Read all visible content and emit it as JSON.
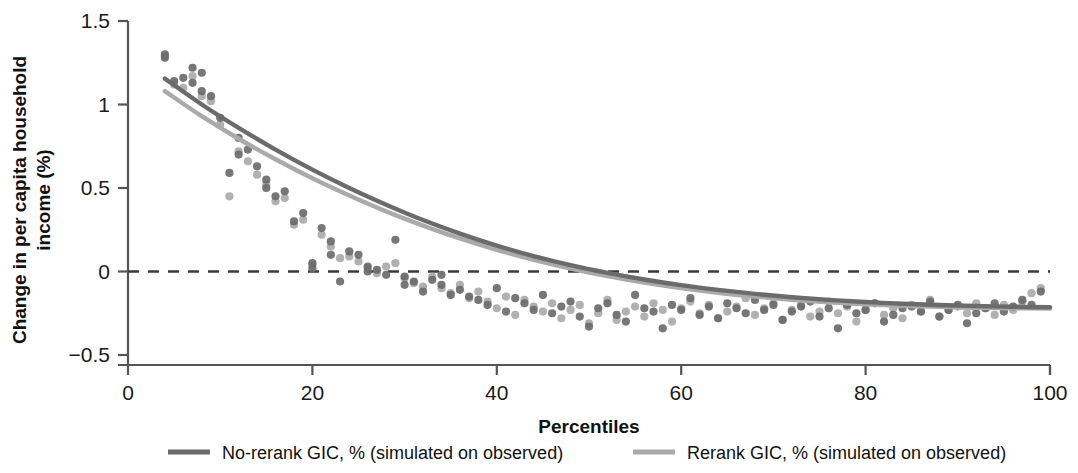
{
  "chart_data": {
    "type": "scatter",
    "title": "",
    "subtitle": "",
    "xlabel": "Percentiles",
    "ylabel": "Change in per capita household income (%)",
    "ylabel_line1": "Change in per capita household",
    "ylabel_line2": "income (%)",
    "xlim": [
      0,
      100
    ],
    "ylim": [
      -0.5,
      1.5
    ],
    "xticks": [
      0,
      20,
      40,
      60,
      80,
      100
    ],
    "xtick_labels": [
      "0",
      "20",
      "40",
      "60",
      "80",
      "100"
    ],
    "yticks": [
      -0.5,
      0,
      0.5,
      1,
      1.5
    ],
    "ytick_labels": [
      "−0.5",
      "0",
      "0.5",
      "1",
      "1.5"
    ],
    "grid": false,
    "legend_position": "bottom",
    "reference_line": {
      "y": 0,
      "style": "dashed",
      "color": "#3a3a3a"
    },
    "colors": {
      "no_rerank": "#6b6b6b",
      "rerank": "#aaaaaa"
    },
    "series": [
      {
        "name": "No-rerank GIC, % (simulated on observed)",
        "color": "#6b6b6b",
        "marker": "circle",
        "x": [
          4,
          4,
          5,
          6,
          7,
          7,
          8,
          8,
          9,
          10,
          11,
          12,
          12,
          13,
          14,
          15,
          15,
          16,
          17,
          18,
          19,
          20,
          20,
          21,
          22,
          22,
          23,
          24,
          25,
          26,
          26,
          27,
          28,
          29,
          30,
          30,
          31,
          32,
          33,
          34,
          34,
          35,
          36,
          37,
          38,
          39,
          40,
          41,
          42,
          43,
          44,
          45,
          46,
          47,
          48,
          49,
          50,
          51,
          52,
          53,
          54,
          55,
          56,
          57,
          58,
          59,
          60,
          61,
          62,
          63,
          64,
          65,
          66,
          67,
          68,
          69,
          70,
          71,
          72,
          73,
          74,
          75,
          76,
          77,
          78,
          79,
          80,
          81,
          82,
          83,
          84,
          85,
          86,
          87,
          88,
          89,
          90,
          91,
          92,
          93,
          94,
          95,
          96,
          97,
          98,
          99
        ],
        "y": [
          1.3,
          1.28,
          1.14,
          1.16,
          1.22,
          1.13,
          1.08,
          1.19,
          1.05,
          0.92,
          0.59,
          0.8,
          0.7,
          0.73,
          0.63,
          0.55,
          0.5,
          0.45,
          0.48,
          0.3,
          0.35,
          0.02,
          0.05,
          0.26,
          0.18,
          0.1,
          -0.06,
          0.12,
          0.1,
          0.03,
          0.0,
          0.01,
          -0.02,
          0.19,
          -0.03,
          -0.08,
          -0.06,
          -0.12,
          -0.05,
          -0.02,
          -0.08,
          -0.14,
          -0.11,
          -0.15,
          -0.17,
          -0.2,
          -0.1,
          -0.24,
          -0.16,
          -0.19,
          -0.23,
          -0.14,
          -0.25,
          -0.21,
          -0.18,
          -0.27,
          -0.33,
          -0.22,
          -0.19,
          -0.26,
          -0.3,
          -0.14,
          -0.22,
          -0.24,
          -0.34,
          -0.2,
          -0.23,
          -0.16,
          -0.26,
          -0.21,
          -0.28,
          -0.19,
          -0.22,
          -0.25,
          -0.17,
          -0.23,
          -0.2,
          -0.29,
          -0.24,
          -0.21,
          -0.18,
          -0.27,
          -0.22,
          -0.34,
          -0.2,
          -0.25,
          -0.23,
          -0.19,
          -0.3,
          -0.26,
          -0.22,
          -0.21,
          -0.24,
          -0.18,
          -0.27,
          -0.23,
          -0.2,
          -0.31,
          -0.25,
          -0.22,
          -0.19,
          -0.24,
          -0.21,
          -0.17,
          -0.2,
          -0.12
        ]
      },
      {
        "name": "Rerank GIC, % (simulated on observed)",
        "color": "#aaaaaa",
        "marker": "circle",
        "x": [
          4,
          5,
          6,
          7,
          8,
          9,
          10,
          11,
          12,
          13,
          14,
          15,
          16,
          17,
          18,
          19,
          20,
          21,
          22,
          23,
          24,
          25,
          26,
          27,
          28,
          29,
          30,
          31,
          32,
          33,
          34,
          35,
          36,
          37,
          38,
          39,
          40,
          41,
          42,
          43,
          44,
          45,
          46,
          47,
          48,
          49,
          50,
          51,
          52,
          53,
          54,
          55,
          56,
          57,
          58,
          59,
          60,
          61,
          62,
          63,
          64,
          65,
          66,
          67,
          68,
          69,
          70,
          71,
          72,
          73,
          74,
          75,
          76,
          77,
          78,
          79,
          80,
          81,
          82,
          83,
          84,
          85,
          86,
          87,
          88,
          89,
          90,
          91,
          92,
          93,
          94,
          95,
          96,
          97,
          98,
          99
        ],
        "y": [
          1.29,
          1.12,
          1.1,
          1.17,
          1.05,
          1.02,
          0.88,
          0.45,
          0.72,
          0.66,
          0.58,
          0.52,
          0.42,
          0.44,
          0.28,
          0.31,
          0.04,
          0.22,
          0.15,
          0.08,
          0.09,
          0.06,
          0.02,
          -0.01,
          0.03,
          0.05,
          -0.04,
          -0.07,
          -0.09,
          -0.03,
          -0.1,
          -0.13,
          -0.08,
          -0.16,
          -0.12,
          -0.18,
          -0.22,
          -0.15,
          -0.26,
          -0.17,
          -0.21,
          -0.24,
          -0.19,
          -0.28,
          -0.23,
          -0.2,
          -0.31,
          -0.25,
          -0.17,
          -0.29,
          -0.24,
          -0.21,
          -0.27,
          -0.19,
          -0.23,
          -0.3,
          -0.22,
          -0.18,
          -0.25,
          -0.2,
          -0.28,
          -0.24,
          -0.21,
          -0.16,
          -0.26,
          -0.22,
          -0.19,
          -0.29,
          -0.23,
          -0.2,
          -0.27,
          -0.24,
          -0.18,
          -0.25,
          -0.21,
          -0.3,
          -0.23,
          -0.19,
          -0.26,
          -0.22,
          -0.28,
          -0.2,
          -0.24,
          -0.17,
          -0.27,
          -0.23,
          -0.21,
          -0.25,
          -0.19,
          -0.22,
          -0.26,
          -0.2,
          -0.23,
          -0.18,
          -0.13,
          -0.1
        ]
      }
    ],
    "fit_curves": [
      {
        "name": "No-rerank GIC, % (simulated on observed)",
        "color": "#6b6b6b",
        "x": [
          4,
          8,
          12,
          16,
          20,
          24,
          28,
          32,
          36,
          40,
          44,
          48,
          52,
          56,
          60,
          64,
          68,
          72,
          76,
          80,
          84,
          88,
          92,
          96,
          100
        ],
        "y": [
          1.155,
          1.0,
          0.86,
          0.73,
          0.61,
          0.5,
          0.4,
          0.308,
          0.227,
          0.155,
          0.092,
          0.038,
          -0.008,
          -0.048,
          -0.082,
          -0.11,
          -0.134,
          -0.154,
          -0.17,
          -0.183,
          -0.193,
          -0.201,
          -0.207,
          -0.211,
          -0.214
        ]
      },
      {
        "name": "Rerank GIC, % (simulated on observed)",
        "color": "#aaaaaa",
        "x": [
          4,
          8,
          12,
          16,
          20,
          24,
          28,
          32,
          36,
          40,
          44,
          48,
          52,
          56,
          60,
          64,
          68,
          72,
          76,
          80,
          84,
          88,
          92,
          96,
          100
        ],
        "y": [
          1.08,
          0.93,
          0.795,
          0.672,
          0.558,
          0.455,
          0.36,
          0.275,
          0.198,
          0.13,
          0.07,
          0.018,
          -0.027,
          -0.066,
          -0.099,
          -0.127,
          -0.15,
          -0.169,
          -0.184,
          -0.196,
          -0.205,
          -0.212,
          -0.217,
          -0.22,
          -0.222
        ]
      }
    ]
  },
  "legend": {
    "items": [
      {
        "label": "No-rerank GIC, % (simulated on observed)",
        "color": "#6b6b6b"
      },
      {
        "label": "Rerank GIC, % (simulated on observed)",
        "color": "#aaaaaa"
      }
    ]
  }
}
